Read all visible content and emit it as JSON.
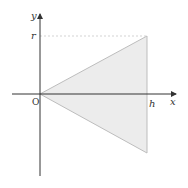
{
  "diagram": {
    "type": "cone-cross-section",
    "labels": {
      "x_axis": "x",
      "y_axis": "y",
      "origin": "O",
      "height": "h",
      "radius": "r"
    },
    "colors": {
      "axis": "#333333",
      "triangle_fill": "#ececec",
      "triangle_stroke": "#bdbdbd",
      "dashed_guide": "#c8c8c8"
    },
    "geometry": {
      "origin_px": [
        40,
        94
      ],
      "apex": [
        0,
        0
      ],
      "upper_vertex": [
        "h",
        "r"
      ],
      "lower_vertex": [
        "h",
        "-r"
      ]
    }
  }
}
